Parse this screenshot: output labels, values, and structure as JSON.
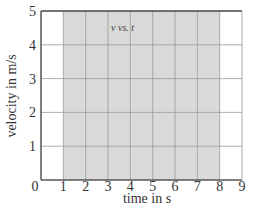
{
  "chart_data": {
    "type": "line",
    "title": "v vs. t",
    "xlabel": "time in s",
    "ylabel": "velocity in m/s",
    "xlim": [
      0,
      9
    ],
    "ylim": [
      0,
      5
    ],
    "x_ticks": [
      "0",
      "1",
      "2",
      "3",
      "4",
      "5",
      "6",
      "7",
      "8",
      "9"
    ],
    "y_ticks": [
      "1",
      "2",
      "3",
      "4",
      "5"
    ],
    "grid": true,
    "series": [],
    "shaded_region": {
      "x_start": 1,
      "x_end": 8,
      "y_start": 0,
      "y_end": 5,
      "color": "#d9d9d9"
    },
    "legend": null
  },
  "colors": {
    "shade": "#d9d9d9",
    "grid": "#9a9a9a",
    "axis": "#555555",
    "frame_top": "#444444"
  },
  "layout": {
    "plot_left": 41,
    "plot_top": 11,
    "plot_right": 242,
    "plot_bottom": 180
  }
}
